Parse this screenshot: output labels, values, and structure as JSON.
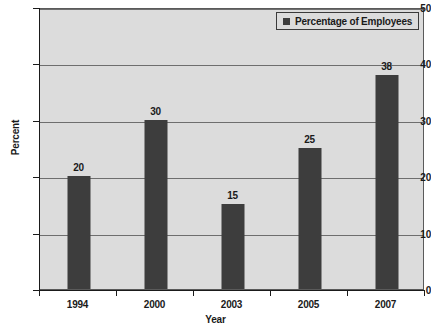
{
  "chart_data": {
    "type": "bar",
    "title": "",
    "categories": [
      "1994",
      "2000",
      "2003",
      "2005",
      "2007"
    ],
    "values": [
      20,
      30,
      15,
      25,
      38
    ],
    "value_labels": [
      "20",
      "30",
      "15",
      "25",
      "38"
    ],
    "series": [
      {
        "name": "Percentage of Employees",
        "values": [
          20,
          30,
          15,
          25,
          38
        ],
        "color": "#3d3d3d"
      }
    ],
    "xlabel": "Year",
    "ylabel": "Percent",
    "ylim": [
      0,
      50
    ],
    "ytick_interval": 10,
    "ytick_labels": [
      "0",
      "10",
      "20",
      "30",
      "40",
      "50"
    ],
    "grid": true,
    "grid_axis": "y",
    "legend": {
      "position": "top-right",
      "entries": [
        {
          "label": "Percentage of Employees",
          "color": "#3d3d3d",
          "marker": "square"
        }
      ]
    },
    "colors": {
      "bar": "#3d3d3d",
      "plot_background": "#dcdcdc",
      "page_background": "#ffffff",
      "axis": "#1a1a1a",
      "gridline": "#6e6e6e",
      "text": "#1a1a1a"
    }
  }
}
